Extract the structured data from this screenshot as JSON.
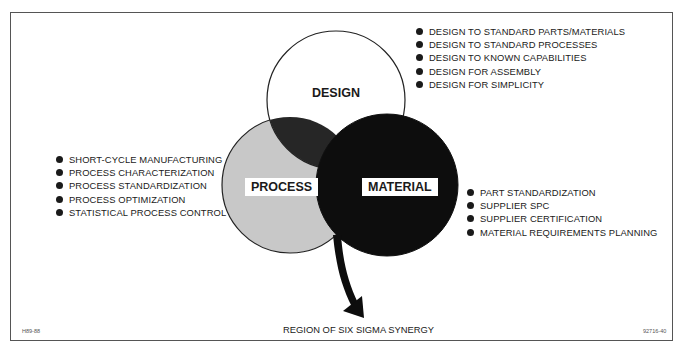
{
  "diagram": {
    "type": "venn",
    "title": "",
    "circles": [
      {
        "name": "DESIGN",
        "fill": "#ffffff"
      },
      {
        "name": "PROCESS",
        "fill": "#c8c8c8"
      },
      {
        "name": "MATERIAL",
        "fill": "#0d0d0d"
      }
    ],
    "overlap_design_process_fill": "#262626",
    "design_items": [
      "DESIGN TO STANDARD PARTS/MATERIALS",
      "DESIGN TO STANDARD PROCESSES",
      "DESIGN TO KNOWN CAPABILITIES",
      "DESIGN FOR ASSEMBLY",
      "DESIGN FOR SIMPLICITY"
    ],
    "process_items": [
      "SHORT-CYCLE MANUFACTURING",
      "PROCESS CHARACTERIZATION",
      "PROCESS STANDARDIZATION",
      "PROCESS OPTIMIZATION",
      "STATISTICAL PROCESS CONTROL"
    ],
    "material_items": [
      "PART STANDARDIZATION",
      "SUPPLIER SPC",
      "SUPPLIER CERTIFICATION",
      "MATERIAL REQUIREMENTS PLANNING"
    ],
    "arrow_label": "REGION OF SIX SIGMA SYNERGY",
    "footer_left_code": "H89-88",
    "footer_right_code": "92716-40"
  }
}
